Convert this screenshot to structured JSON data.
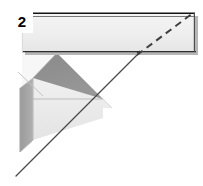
{
  "figure": {
    "label": "2",
    "caption": "",
    "background_color": "#ffffff",
    "width": 203,
    "height": 186
  },
  "colors": {
    "background": "#ffffff",
    "outline_dark": "#2b2b2b",
    "outline_mid": "#6f6f6f",
    "bar_face": "#eeeeee",
    "bar_face_light": "#f6f6f6",
    "bar_edge_top": "#1c1c1c",
    "bar_edge_bottom": "#3a3a3a",
    "bar_side_shadow": "#9a9a9a",
    "prism_roof_dark": "#8d8d8d",
    "prism_roof_light": "#f2f2f2",
    "prism_front_light": "#ededed",
    "prism_side_dark": "#9b9b9b",
    "prism_outline": "#b4b4b4",
    "diagonal_line": "#4a4a4a",
    "dashed_line": "#555555",
    "thin_ray": "#bdbdbd",
    "label_text": "#000000"
  },
  "elements": {
    "bar": {
      "name": "horizontal-bar",
      "description": "light gray horizontal rectangular bar across the top",
      "x": 22,
      "y": 12,
      "width": 173,
      "height": 41
    },
    "prism": {
      "name": "triangular-prism",
      "description": "three dimensional prism with dark gray roof face, light front face and gray left side face",
      "apex_x": 57,
      "apex_y": 53,
      "base_y": 145
    },
    "diagonal_solid": {
      "name": "solid-diagonal-line",
      "x1": 16,
      "y1": 175,
      "x2": 139,
      "y2": 52
    },
    "diagonal_dashed": {
      "name": "dashed-diagonal-line",
      "x1": 139,
      "y1": 52,
      "x2": 193,
      "y2": 13
    },
    "thin_ray": {
      "name": "thin-construction-ray",
      "x1": 18,
      "y1": 72,
      "x2": 42,
      "y2": 95
    }
  },
  "annotations": []
}
